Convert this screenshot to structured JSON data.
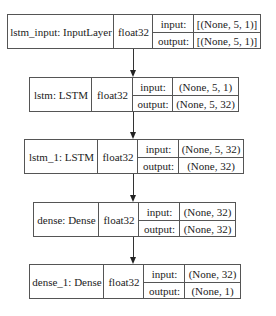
{
  "diagram": {
    "layers": [
      {
        "name_label": "lstm_input: InputLayer",
        "dtype": "float32",
        "input_label": "input:",
        "output_label": "output:",
        "input_shape": "[(None, 5, 1)]",
        "output_shape": "[(None, 5, 1)]",
        "box": {
          "left": 7,
          "top": 14,
          "right": 261,
          "bottom": 49,
          "col1": 113,
          "col2": 152,
          "col3": 193
        }
      },
      {
        "name_label": "lstm: LSTM",
        "dtype": "float32",
        "input_label": "input:",
        "output_label": "output:",
        "input_shape": "(None, 5, 1)",
        "output_shape": "(None, 5, 32)",
        "box": {
          "left": 29,
          "top": 77,
          "right": 239,
          "bottom": 112,
          "col1": 91,
          "col2": 132,
          "col3": 172
        }
      },
      {
        "name_label": "lstm_1: LSTM",
        "dtype": "float32",
        "input_label": "input:",
        "output_label": "output:",
        "input_shape": "(None, 5, 32)",
        "output_shape": "(None, 32)",
        "box": {
          "left": 24,
          "top": 139,
          "right": 244,
          "bottom": 174,
          "col1": 97,
          "col2": 137,
          "col3": 178
        }
      },
      {
        "name_label": "dense: Dense",
        "dtype": "float32",
        "input_label": "input:",
        "output_label": "output:",
        "input_shape": "(None, 32)",
        "output_shape": "(None, 32)",
        "box": {
          "left": 33,
          "top": 202,
          "right": 236,
          "bottom": 237,
          "col1": 98,
          "col2": 138,
          "col3": 179
        }
      },
      {
        "name_label": "dense_1: Dense",
        "dtype": "float32",
        "input_label": "input:",
        "output_label": "output:",
        "input_shape": "(None, 32)",
        "output_shape": "(None, 1)",
        "box": {
          "left": 29,
          "top": 264,
          "right": 241,
          "bottom": 299,
          "col1": 103,
          "col2": 143,
          "col3": 184
        }
      }
    ],
    "edges": [
      {
        "from": "lstm_input",
        "to": "lstm"
      },
      {
        "from": "lstm",
        "to": "lstm_1"
      },
      {
        "from": "lstm_1",
        "to": "dense"
      },
      {
        "from": "dense",
        "to": "dense_1"
      }
    ],
    "edge_x": 133,
    "colors": {
      "border": "#555555",
      "text": "#222222",
      "background": "#ffffff"
    }
  }
}
